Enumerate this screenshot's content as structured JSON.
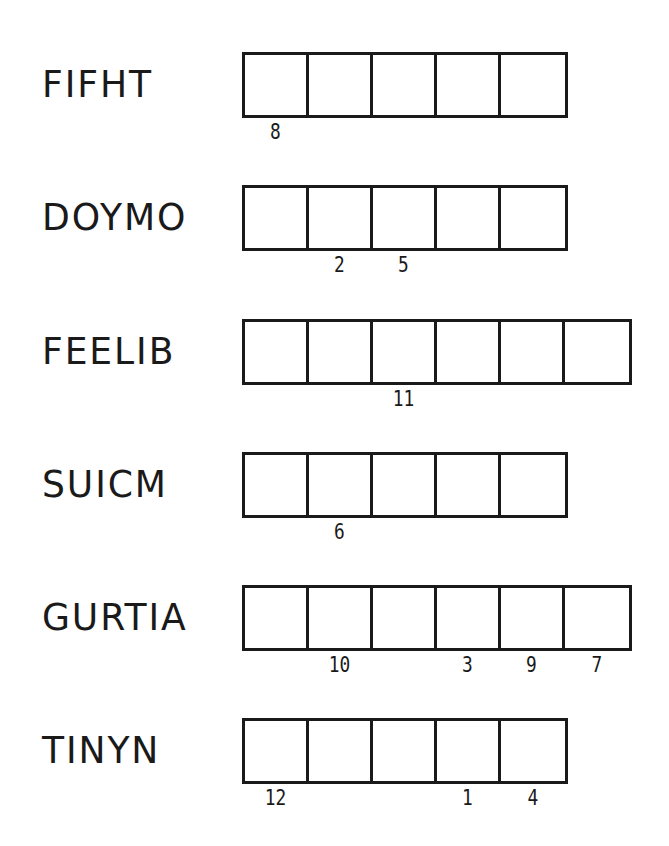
{
  "puzzle": {
    "rows": [
      {
        "word": "FIFHT",
        "cells": 5,
        "numbers": [
          "8",
          "",
          "",
          "",
          ""
        ]
      },
      {
        "word": "DOYMO",
        "cells": 5,
        "numbers": [
          "",
          "2",
          "5",
          "",
          ""
        ]
      },
      {
        "word": "FEELIB",
        "cells": 6,
        "numbers": [
          "",
          "",
          "11",
          "",
          "",
          ""
        ]
      },
      {
        "word": "SUICM",
        "cells": 5,
        "numbers": [
          "",
          "6",
          "",
          "",
          ""
        ]
      },
      {
        "word": "GURTIA",
        "cells": 6,
        "numbers": [
          "",
          "10",
          "",
          "3",
          "9",
          "7"
        ]
      },
      {
        "word": "TINYN",
        "cells": 5,
        "numbers": [
          "12",
          "",
          "",
          "1",
          "4"
        ]
      }
    ]
  },
  "colors": {
    "ink": "#1a1a1a",
    "background": "#ffffff"
  }
}
